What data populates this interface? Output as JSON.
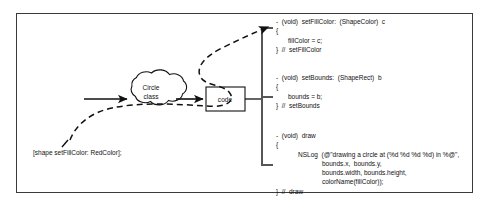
{
  "figure": {
    "caption": "",
    "colors": {
      "object_fill": "#4a4a4a",
      "stroke": "#111111",
      "frame": "#3a3a3a",
      "text": "#111111",
      "object_text": "#ffffff"
    }
  },
  "object_node": {
    "name": "circle-object",
    "lines": [
      "0,  0,",
      "10,  30",
      "Red",
      "(Circle)"
    ]
  },
  "cloud_node": {
    "name": "circle-class-cloud",
    "lines": [
      "Circle",
      "class"
    ]
  },
  "code_box": {
    "label": "code"
  },
  "callout": {
    "text": "[shape setFillColor: RedColor];"
  },
  "methods": [
    {
      "name": "setFillColor",
      "lines": [
        {
          "text": "-  (void)  setFillColor:  (ShapeColor)  c",
          "indent": 0
        },
        {
          "text": "{",
          "indent": 0
        },
        {
          "text": "fillColor = c;",
          "indent": 1
        },
        {
          "text": "}  //  setFillColor",
          "indent": 0
        }
      ]
    },
    {
      "name": "setBounds",
      "lines": [
        {
          "text": "-  (void)  setBounds:  (ShapeRect)  b",
          "indent": 0
        },
        {
          "text": "{",
          "indent": 0
        },
        {
          "text": "bounds = b;",
          "indent": 1
        },
        {
          "text": "}  //  setBounds",
          "indent": 0
        }
      ]
    },
    {
      "name": "draw",
      "lines": [
        {
          "text": "-  (void)  draw",
          "indent": 0
        },
        {
          "text": "{",
          "indent": 0
        },
        {
          "text": "NSLog  (@\"drawing a circle at (%d %d %d %d) in %@\",",
          "indent": 2
        },
        {
          "text": "bounds.x,  bounds.y,",
          "indent": 3
        },
        {
          "text": "bounds.width, bounds.height,",
          "indent": 3
        },
        {
          "text": "colorName(fillColor));",
          "indent": 3
        },
        {
          "text": "}  //  draw",
          "indent": 0
        }
      ]
    }
  ],
  "connectors": {
    "solid_object_to_cloud": "object-to-class-arrow",
    "solid_cloud_to_code": "class-to-code-arrow",
    "dashed_message_flow": "message-send-dashed-arrow",
    "bracket": "code-to-methods-bracket"
  }
}
